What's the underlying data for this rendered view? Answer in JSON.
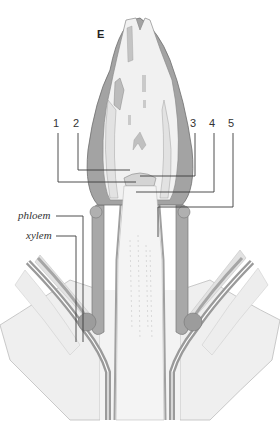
{
  "figure": {
    "panel_label": "E",
    "callouts": [
      {
        "id": "1",
        "label": "1",
        "x": 57,
        "y": 120
      },
      {
        "id": "2",
        "label": "2",
        "x": 75,
        "y": 120
      },
      {
        "id": "3",
        "label": "3",
        "x": 189,
        "y": 120
      },
      {
        "id": "4",
        "label": "4",
        "x": 208,
        "y": 120
      },
      {
        "id": "5",
        "label": "5",
        "x": 227,
        "y": 120
      }
    ],
    "tissue_labels": [
      {
        "id": "phloem",
        "label": "phloem",
        "x": 18,
        "y": 212
      },
      {
        "id": "xylem",
        "label": "xylem",
        "x": 26,
        "y": 232
      }
    ],
    "colors": {
      "background": "#ffffff",
      "leaf_dark": "#9a9a9a",
      "leaf_mid": "#b8b8b8",
      "tissue_light": "#ececec",
      "outline": "#6e6e6e",
      "leader_line": "#3a3a3a"
    }
  }
}
